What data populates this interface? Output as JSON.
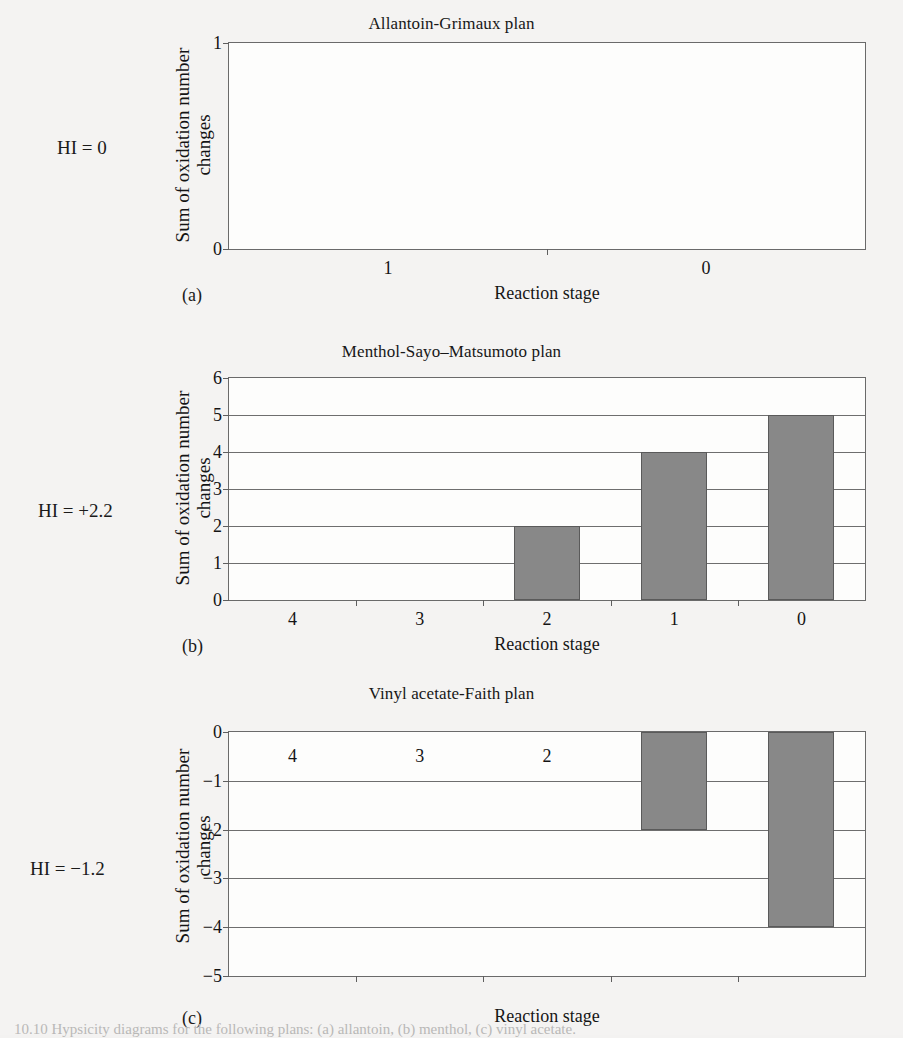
{
  "figure": {
    "background_color": "#f3f2f1",
    "bar_color": "#888888",
    "axis_color": "#6a6a6a",
    "caption_partial": "10.10   Hypsicity diagrams for the following plans: (a) allantoin, (b) menthol, (c) vinyl acetate."
  },
  "panels": [
    {
      "key": "a",
      "sublabel": "(a)",
      "hi_label": "HI = 0",
      "title": "Allantoin-Grimaux plan",
      "xlabel": "Reaction stage",
      "ylabel": "Sum of oxidation number\nchanges",
      "ylabel_line1": "Sum of oxidation number",
      "ylabel_line2": "changes"
    },
    {
      "key": "b",
      "sublabel": "(b)",
      "hi_label": "HI = +2.2",
      "title": "Menthol-Sayo–Matsumoto plan",
      "xlabel": "Reaction stage",
      "ylabel_line1": "Sum of oxidation number",
      "ylabel_line2": "changes"
    },
    {
      "key": "c",
      "sublabel": "(c)",
      "hi_label": "HI = −1.2",
      "title": "Vinyl acetate-Faith plan",
      "xlabel": "Reaction stage",
      "ylabel_line1": "Sum of oxidation number",
      "ylabel_line2": "changes"
    }
  ],
  "chart_data": [
    {
      "type": "bar",
      "panel": "a",
      "title": "Allantoin-Grimaux plan",
      "xlabel": "Reaction stage",
      "ylabel": "Sum of oxidation number changes",
      "categories": [
        "1",
        "0"
      ],
      "values": [
        0,
        0
      ],
      "ylim": [
        0,
        1
      ],
      "yticks": [
        0,
        1
      ],
      "ytick_labels": [
        "0",
        "1"
      ],
      "grid": false,
      "legend": "none",
      "annotation": "HI = 0"
    },
    {
      "type": "bar",
      "panel": "b",
      "title": "Menthol-Sayo–Matsumoto plan",
      "xlabel": "Reaction stage",
      "ylabel": "Sum of oxidation number changes",
      "categories": [
        "4",
        "3",
        "2",
        "1",
        "0"
      ],
      "values": [
        0,
        0,
        2,
        4,
        5
      ],
      "ylim": [
        0,
        6
      ],
      "yticks": [
        0,
        1,
        2,
        3,
        4,
        5,
        6
      ],
      "ytick_labels": [
        "0",
        "1",
        "2",
        "3",
        "4",
        "5",
        "6"
      ],
      "grid": true,
      "legend": "none",
      "annotation": "HI = +2.2"
    },
    {
      "type": "bar",
      "panel": "c",
      "title": "Vinyl acetate-Faith plan",
      "xlabel": "Reaction stage",
      "ylabel": "Sum of oxidation number changes",
      "categories": [
        "4",
        "3",
        "2",
        "1",
        "0"
      ],
      "values": [
        0,
        0,
        0,
        -2,
        -4
      ],
      "ylim": [
        -5,
        0
      ],
      "yticks": [
        0,
        -1,
        -2,
        -3,
        -4,
        -5
      ],
      "ytick_labels": [
        "0",
        "−1",
        "−2",
        "−3",
        "−4",
        "−5"
      ],
      "grid": true,
      "legend": "none",
      "category_labels_inside": true,
      "annotation": "HI = −1.2"
    }
  ]
}
